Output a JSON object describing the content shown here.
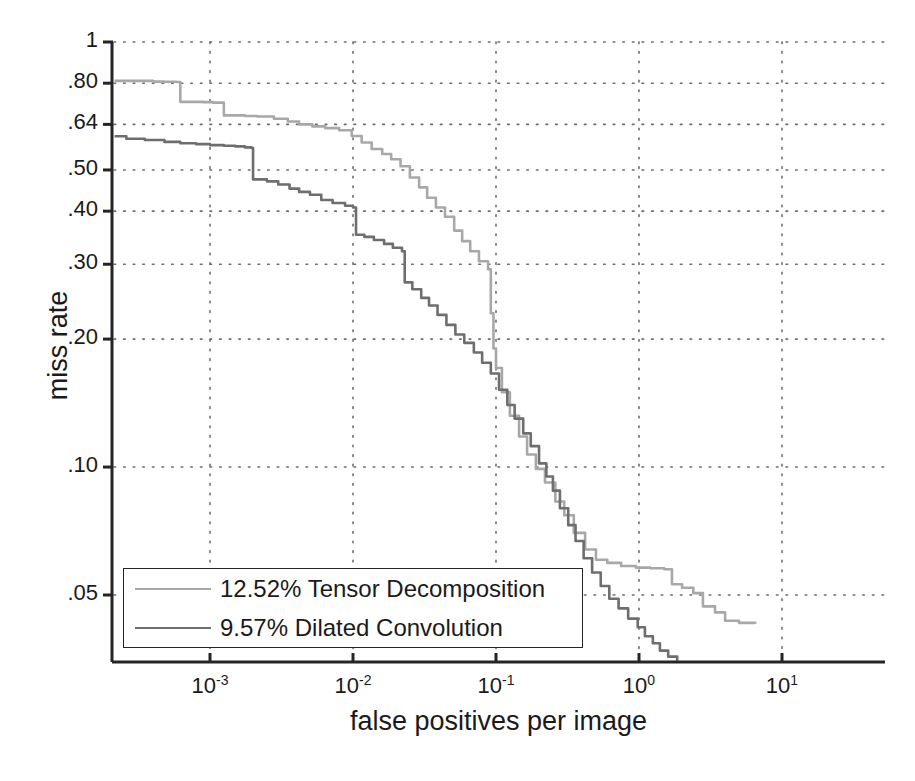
{
  "chart_data": {
    "type": "line",
    "title": "",
    "subtitle": "",
    "xlabel": "false positives per image",
    "ylabel": "miss rate",
    "xscale": "log",
    "yscale": "log-miss-rate",
    "xlim": [
      0.000209,
      22.4
    ],
    "ylim": [
      0.035,
      1.0
    ],
    "grid": true,
    "grid_style": "dotted",
    "legend_position": "lower-left",
    "xticks": [
      {
        "value": 0.001,
        "label": "10",
        "exponent": "-3"
      },
      {
        "value": 0.01,
        "label": "10",
        "exponent": "-2"
      },
      {
        "value": 0.1,
        "label": "10",
        "exponent": "-1"
      },
      {
        "value": 1.0,
        "label": "10",
        "exponent": "0"
      },
      {
        "value": 10.0,
        "label": "10",
        "exponent": "1"
      }
    ],
    "yticks": [
      {
        "value": 1.0,
        "label": "1"
      },
      {
        "value": 0.8,
        "label": ".80"
      },
      {
        "value": 0.64,
        "label": ".64"
      },
      {
        "value": 0.5,
        "label": ".50"
      },
      {
        "value": 0.4,
        "label": ".40"
      },
      {
        "value": 0.3,
        "label": ".30"
      },
      {
        "value": 0.2,
        "label": ".20"
      },
      {
        "value": 0.1,
        "label": ".10"
      },
      {
        "value": 0.05,
        "label": ".05"
      }
    ],
    "series": [
      {
        "name": "12.52% Tensor Decomposition",
        "legend_label": "12.52% Tensor Decomposition",
        "log_average_miss_rate_percent": 12.52,
        "method": "Tensor Decomposition",
        "color": "#a8a8a8",
        "points": [
          [
            0.000215,
            0.81
          ],
          [
            0.00032,
            0.81
          ],
          [
            0.0004,
            0.807
          ],
          [
            0.00048,
            0.806
          ],
          [
            0.00058,
            0.805
          ],
          [
            0.00062,
            0.723
          ],
          [
            0.0009,
            0.722
          ],
          [
            0.00105,
            0.72
          ],
          [
            0.00125,
            0.672
          ],
          [
            0.00175,
            0.67
          ],
          [
            0.00215,
            0.668
          ],
          [
            0.0028,
            0.66
          ],
          [
            0.0035,
            0.65
          ],
          [
            0.0042,
            0.64
          ],
          [
            0.0052,
            0.633
          ],
          [
            0.0064,
            0.627
          ],
          [
            0.008,
            0.62
          ],
          [
            0.0098,
            0.601
          ],
          [
            0.0115,
            0.58
          ],
          [
            0.0135,
            0.56
          ],
          [
            0.016,
            0.545
          ],
          [
            0.0185,
            0.53
          ],
          [
            0.0215,
            0.51
          ],
          [
            0.025,
            0.48
          ],
          [
            0.029,
            0.455
          ],
          [
            0.033,
            0.43
          ],
          [
            0.038,
            0.408
          ],
          [
            0.044,
            0.388
          ],
          [
            0.051,
            0.36
          ],
          [
            0.058,
            0.34
          ],
          [
            0.066,
            0.322
          ],
          [
            0.076,
            0.305
          ],
          [
            0.088,
            0.292
          ],
          [
            0.092,
            0.23
          ],
          [
            0.096,
            0.19
          ],
          [
            0.1,
            0.171
          ],
          [
            0.11,
            0.15
          ],
          [
            0.125,
            0.132
          ],
          [
            0.145,
            0.118
          ],
          [
            0.165,
            0.107
          ],
          [
            0.19,
            0.099
          ],
          [
            0.22,
            0.092
          ],
          [
            0.26,
            0.083
          ],
          [
            0.3,
            0.077
          ],
          [
            0.35,
            0.07
          ],
          [
            0.42,
            0.064
          ],
          [
            0.5,
            0.0605
          ],
          [
            0.6,
            0.0595
          ],
          [
            0.75,
            0.0585
          ],
          [
            0.95,
            0.058
          ],
          [
            1.2,
            0.0578
          ],
          [
            1.5,
            0.0575
          ],
          [
            1.7,
            0.053
          ],
          [
            2.0,
            0.052
          ],
          [
            2.4,
            0.0505
          ],
          [
            2.8,
            0.047
          ],
          [
            3.4,
            0.0455
          ],
          [
            4.0,
            0.0435
          ],
          [
            5.0,
            0.043
          ],
          [
            6.5,
            0.0428
          ]
        ]
      },
      {
        "name": "9.57% Dilated Convolution",
        "legend_label": "9.57% Dilated Convolution",
        "log_average_miss_rate_percent": 9.57,
        "method": "Dilated Convolution",
        "color": "#6e6e6e",
        "points": [
          [
            0.000215,
            0.6
          ],
          [
            0.00026,
            0.592
          ],
          [
            0.00035,
            0.588
          ],
          [
            0.00048,
            0.582
          ],
          [
            0.00062,
            0.578
          ],
          [
            0.0008,
            0.575
          ],
          [
            0.001,
            0.572
          ],
          [
            0.00125,
            0.57
          ],
          [
            0.0015,
            0.568
          ],
          [
            0.00175,
            0.565
          ],
          [
            0.00195,
            0.563
          ],
          [
            0.002,
            0.475
          ],
          [
            0.0025,
            0.47
          ],
          [
            0.003,
            0.462
          ],
          [
            0.0036,
            0.452
          ],
          [
            0.0042,
            0.444
          ],
          [
            0.005,
            0.437
          ],
          [
            0.006,
            0.425
          ],
          [
            0.0072,
            0.418
          ],
          [
            0.0088,
            0.412
          ],
          [
            0.01,
            0.408
          ],
          [
            0.0105,
            0.352
          ],
          [
            0.012,
            0.348
          ],
          [
            0.014,
            0.342
          ],
          [
            0.0165,
            0.335
          ],
          [
            0.019,
            0.328
          ],
          [
            0.022,
            0.322
          ],
          [
            0.023,
            0.272
          ],
          [
            0.026,
            0.262
          ],
          [
            0.03,
            0.25
          ],
          [
            0.034,
            0.24
          ],
          [
            0.039,
            0.228
          ],
          [
            0.045,
            0.216
          ],
          [
            0.052,
            0.205
          ],
          [
            0.06,
            0.196
          ],
          [
            0.07,
            0.186
          ],
          [
            0.08,
            0.176
          ],
          [
            0.092,
            0.166
          ],
          [
            0.105,
            0.152
          ],
          [
            0.12,
            0.14
          ],
          [
            0.135,
            0.13
          ],
          [
            0.155,
            0.12
          ],
          [
            0.175,
            0.112
          ],
          [
            0.2,
            0.102
          ],
          [
            0.225,
            0.095
          ],
          [
            0.25,
            0.088
          ],
          [
            0.28,
            0.08
          ],
          [
            0.32,
            0.073
          ],
          [
            0.36,
            0.067
          ],
          [
            0.41,
            0.061
          ],
          [
            0.47,
            0.0565
          ],
          [
            0.54,
            0.0525
          ],
          [
            0.62,
            0.049
          ],
          [
            0.72,
            0.0465
          ],
          [
            0.84,
            0.044
          ],
          [
            0.98,
            0.042
          ],
          [
            1.1,
            0.04
          ],
          [
            1.25,
            0.0385
          ],
          [
            1.4,
            0.037
          ],
          [
            1.6,
            0.0358
          ],
          [
            1.85,
            0.035
          ]
        ]
      }
    ],
    "annotations": []
  },
  "axes": {
    "ylabel": "miss rate",
    "xlabel": "false positives per image"
  },
  "legend": {
    "items": [
      {
        "label": "12.52% Tensor Decomposition",
        "color": "#a8a8a8"
      },
      {
        "label": "9.57% Dilated Convolution",
        "color": "#6e6e6e"
      }
    ]
  },
  "colors": {
    "axis": "#252525",
    "grid": "#6b6b6b",
    "text": "#1a1a1a",
    "background": "#ffffff",
    "series_1": "#a8a8a8",
    "series_2": "#6e6e6e"
  }
}
